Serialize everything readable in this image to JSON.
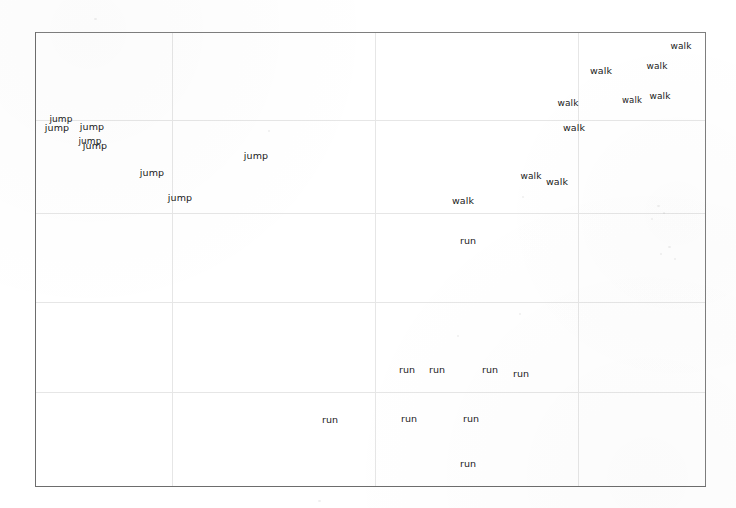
{
  "figure": {
    "width": 736,
    "height": 508,
    "background_color": "#ffffff",
    "frame_color": "#7e7e7e",
    "grid_color": "#e6e6e6",
    "label_color": "#191919",
    "plot_left": 35,
    "plot_top": 32,
    "plot_right": 706,
    "plot_bottom": 487
  },
  "chart_data": {
    "type": "scatter",
    "title": "",
    "subtitle": "",
    "xlabel": "",
    "ylabel": "",
    "xticklabels": [],
    "yticklabels": [],
    "xlim": [
      0,
      1
    ],
    "ylim": [
      0,
      1
    ],
    "grid": true,
    "grid_x_positions_px": [
      172,
      375,
      578
    ],
    "grid_y_positions_px": [
      120,
      213,
      302,
      392
    ],
    "legend": "none",
    "marker_style": "text",
    "classes": [
      "jump",
      "walk",
      "run"
    ],
    "series": [
      {
        "name": "jump",
        "color": "#191919",
        "count": 9,
        "points": [
          {
            "label": "jump",
            "x": 61,
            "y": 119,
            "size": 9.0
          },
          {
            "label": "jump",
            "x": 57,
            "y": 128,
            "size": 9.5
          },
          {
            "label": "jump",
            "x": 92,
            "y": 127,
            "size": 9.5
          },
          {
            "label": "jump",
            "x": 90,
            "y": 141,
            "size": 9.0
          },
          {
            "label": "jump",
            "x": 95,
            "y": 146,
            "size": 9.5
          },
          {
            "label": "jump",
            "x": 152,
            "y": 173,
            "size": 9.5
          },
          {
            "label": "jump",
            "x": 256,
            "y": 156,
            "size": 9.5
          },
          {
            "label": "jump",
            "x": 180,
            "y": 198,
            "size": 9.5
          }
        ]
      },
      {
        "name": "walk",
        "color": "#191919",
        "count": 11,
        "points": [
          {
            "label": "walk",
            "x": 681,
            "y": 46,
            "size": 9.0
          },
          {
            "label": "walk",
            "x": 657,
            "y": 66,
            "size": 9.0
          },
          {
            "label": "walk",
            "x": 601,
            "y": 71,
            "size": 9.5
          },
          {
            "label": "walk",
            "x": 660,
            "y": 96,
            "size": 9.0
          },
          {
            "label": "walk",
            "x": 632,
            "y": 100,
            "size": 8.5
          },
          {
            "label": "walk",
            "x": 568,
            "y": 103,
            "size": 9.0
          },
          {
            "label": "walk",
            "x": 574,
            "y": 128,
            "size": 9.5
          },
          {
            "label": "walk",
            "x": 531,
            "y": 176,
            "size": 9.0
          },
          {
            "label": "walk",
            "x": 557,
            "y": 182,
            "size": 9.5
          },
          {
            "label": "walk",
            "x": 463,
            "y": 201,
            "size": 9.5
          }
        ]
      },
      {
        "name": "run",
        "color": "#191919",
        "count": 9,
        "points": [
          {
            "label": "run",
            "x": 468,
            "y": 241,
            "size": 9.5
          },
          {
            "label": "run",
            "x": 407,
            "y": 370,
            "size": 9.5
          },
          {
            "label": "run",
            "x": 437,
            "y": 370,
            "size": 9.5
          },
          {
            "label": "run",
            "x": 490,
            "y": 370,
            "size": 9.5
          },
          {
            "label": "run",
            "x": 521,
            "y": 374,
            "size": 9.5
          },
          {
            "label": "run",
            "x": 330,
            "y": 420,
            "size": 9.5
          },
          {
            "label": "run",
            "x": 409,
            "y": 419,
            "size": 9.5
          },
          {
            "label": "run",
            "x": 471,
            "y": 419,
            "size": 9.5
          },
          {
            "label": "run",
            "x": 468,
            "y": 464,
            "size": 9.5
          }
        ]
      }
    ]
  },
  "speckles": [
    {
      "x": 657,
      "y": 205,
      "w": 3,
      "h": 2
    },
    {
      "x": 663,
      "y": 212,
      "w": 2,
      "h": 2
    },
    {
      "x": 651,
      "y": 218,
      "w": 2,
      "h": 2
    },
    {
      "x": 668,
      "y": 246,
      "w": 3,
      "h": 2
    },
    {
      "x": 660,
      "y": 253,
      "w": 2,
      "h": 2
    },
    {
      "x": 674,
      "y": 258,
      "w": 2,
      "h": 2
    },
    {
      "x": 519,
      "y": 313,
      "w": 2,
      "h": 2
    },
    {
      "x": 522,
      "y": 196,
      "w": 2,
      "h": 2
    },
    {
      "x": 457,
      "y": 335,
      "w": 2,
      "h": 2
    },
    {
      "x": 268,
      "y": 130,
      "w": 2,
      "h": 2
    },
    {
      "x": 94,
      "y": 18,
      "w": 3,
      "h": 2
    },
    {
      "x": 318,
      "y": 500,
      "w": 3,
      "h": 2
    }
  ]
}
